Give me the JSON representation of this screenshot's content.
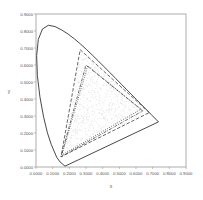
{
  "chart_data": {
    "type": "line",
    "title": "",
    "xlabel": "x",
    "ylabel": "y",
    "xlim": [
      0,
      0.9
    ],
    "ylim": [
      0,
      0.9
    ],
    "grid": false,
    "legend": "none",
    "x_ticks": [
      "0.0000",
      "0.1000",
      "0.2000",
      "0.3000",
      "0.4000",
      "0.5000",
      "0.6000",
      "0.7000",
      "0.8000",
      "0.9000"
    ],
    "y_ticks": [
      "0.0000",
      "0.1000",
      "0.2000",
      "0.3000",
      "0.4000",
      "0.5000",
      "0.6000",
      "0.7000",
      "0.8000",
      "0.9000"
    ],
    "series": [
      {
        "name": "spectral-locus",
        "style": "solid",
        "points": [
          [
            0.1741,
            0.005
          ],
          [
            0.144,
            0.0297
          ],
          [
            0.1241,
            0.0578
          ],
          [
            0.0913,
            0.1327
          ],
          [
            0.0687,
            0.2007
          ],
          [
            0.0454,
            0.295
          ],
          [
            0.0235,
            0.4127
          ],
          [
            0.0082,
            0.5384
          ],
          [
            0.0039,
            0.6548
          ],
          [
            0.0139,
            0.7502
          ],
          [
            0.0389,
            0.812
          ],
          [
            0.0743,
            0.8338
          ],
          [
            0.1142,
            0.8262
          ],
          [
            0.1547,
            0.8059
          ],
          [
            0.1929,
            0.7816
          ],
          [
            0.2296,
            0.7543
          ],
          [
            0.2658,
            0.7243
          ],
          [
            0.3016,
            0.6923
          ],
          [
            0.3373,
            0.6589
          ],
          [
            0.3731,
            0.6245
          ],
          [
            0.4087,
            0.5896
          ],
          [
            0.4441,
            0.5547
          ],
          [
            0.4788,
            0.5202
          ],
          [
            0.5125,
            0.4866
          ],
          [
            0.5448,
            0.4544
          ],
          [
            0.5752,
            0.4242
          ],
          [
            0.6029,
            0.3965
          ],
          [
            0.627,
            0.3725
          ],
          [
            0.6482,
            0.3514
          ],
          [
            0.6658,
            0.334
          ],
          [
            0.6801,
            0.3197
          ],
          [
            0.6915,
            0.3083
          ],
          [
            0.7347,
            0.2653
          ],
          [
            0.1741,
            0.005
          ]
        ]
      },
      {
        "name": "gamut-dashed",
        "style": "dashed",
        "points": [
          [
            0.68,
            0.32
          ],
          [
            0.265,
            0.69
          ],
          [
            0.15,
            0.06
          ],
          [
            0.68,
            0.32
          ]
        ]
      },
      {
        "name": "gamut-dash-dot",
        "style": "dashdot",
        "points": [
          [
            0.64,
            0.33
          ],
          [
            0.3,
            0.6
          ],
          [
            0.15,
            0.06
          ],
          [
            0.64,
            0.33
          ]
        ]
      },
      {
        "name": "gamut-dotted",
        "style": "dotted",
        "points": [
          [
            0.63,
            0.34
          ],
          [
            0.31,
            0.595
          ],
          [
            0.155,
            0.07
          ],
          [
            0.63,
            0.34
          ]
        ]
      }
    ],
    "scatter_cloud": {
      "description": "dense light-gray scatter points filling inside of gamut triangles",
      "color": "#d8d8d8"
    }
  },
  "axes": {
    "x_label": "x",
    "y_label": "y"
  },
  "colors": {
    "frame": "#999999",
    "locus": "#333333",
    "gamut": "#444444",
    "scatter": "#d8d8d8",
    "text": "#555555"
  }
}
